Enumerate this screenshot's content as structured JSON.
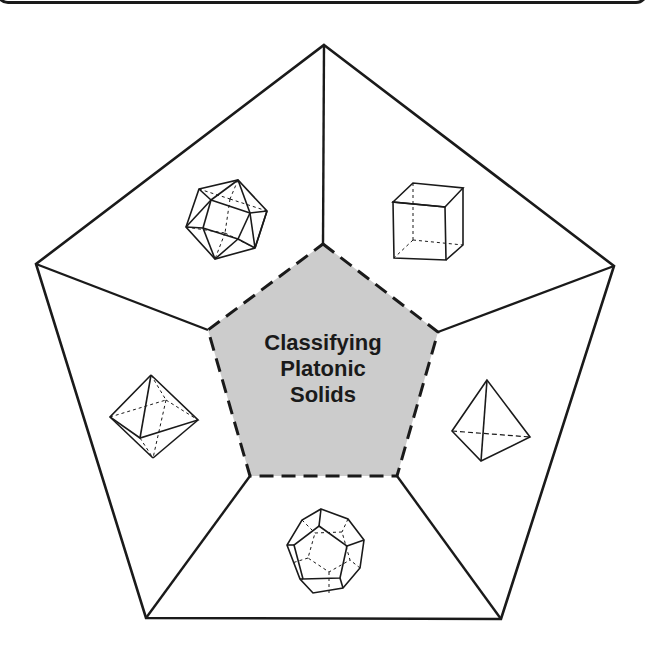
{
  "diagram": {
    "title_lines": [
      "Classifying",
      "Platonic",
      "Solids"
    ],
    "center_fill": "#cccccc",
    "stroke_color": "#1a1a1a",
    "background": "#ffffff",
    "outer_pentagon": [
      [
        324,
        45
      ],
      [
        614,
        266
      ],
      [
        501,
        619
      ],
      [
        146,
        618
      ],
      [
        36,
        264
      ]
    ],
    "inner_pentagon": [
      [
        323,
        244
      ],
      [
        438,
        332
      ],
      [
        397,
        476
      ],
      [
        250,
        476
      ],
      [
        208,
        330
      ]
    ],
    "sections": [
      {
        "position": "top-left",
        "solid": "icosahedron",
        "icon": "icosahedron-icon"
      },
      {
        "position": "top-right",
        "solid": "cube",
        "icon": "cube-icon"
      },
      {
        "position": "left",
        "solid": "octahedron",
        "icon": "octahedron-icon"
      },
      {
        "position": "right",
        "solid": "tetrahedron",
        "icon": "tetrahedron-icon"
      },
      {
        "position": "bottom",
        "solid": "dodecahedron",
        "icon": "dodecahedron-icon"
      }
    ]
  }
}
